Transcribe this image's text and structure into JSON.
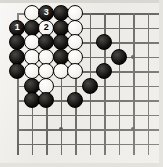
{
  "figure": {
    "board_size_label": "19x19 (corner excerpt)",
    "background_color": "#efeeea",
    "line_color": "#262421",
    "black_stone_color": "#131110",
    "white_stone_color": "#f4f3ef"
  },
  "geometry": {
    "origin_x": 17,
    "origin_y": 13,
    "spacing": 14.5,
    "cols": 10,
    "rows": 10,
    "stone_diameter": 16
  },
  "star_points": [
    {
      "col": 4,
      "row": 9,
      "name": "star-point-lower-left"
    },
    {
      "col": 9,
      "row": 9,
      "name": "star-point-lower-right"
    },
    {
      "col": 9,
      "row": 4,
      "name": "star-point-upper-right"
    }
  ],
  "stones": [
    {
      "col": 2,
      "row": 1,
      "color": "white",
      "label": ""
    },
    {
      "col": 3,
      "row": 1,
      "color": "black",
      "label": "3"
    },
    {
      "col": 4,
      "row": 1,
      "color": "black",
      "label": ""
    },
    {
      "col": 5,
      "row": 1,
      "color": "white",
      "label": ""
    },
    {
      "col": 1,
      "row": 2,
      "color": "black",
      "label": "1"
    },
    {
      "col": 2,
      "row": 2,
      "color": "black",
      "label": ""
    },
    {
      "col": 3,
      "row": 2,
      "color": "white",
      "label": "2"
    },
    {
      "col": 4,
      "row": 2,
      "color": "black",
      "label": ""
    },
    {
      "col": 5,
      "row": 2,
      "color": "white",
      "label": ""
    },
    {
      "col": 1,
      "row": 3,
      "color": "black",
      "label": ""
    },
    {
      "col": 2,
      "row": 3,
      "color": "white",
      "label": ""
    },
    {
      "col": 3,
      "row": 3,
      "color": "black",
      "label": ""
    },
    {
      "col": 4,
      "row": 3,
      "color": "black",
      "label": ""
    },
    {
      "col": 5,
      "row": 3,
      "color": "white",
      "label": ""
    },
    {
      "col": 7,
      "row": 3,
      "color": "black",
      "label": ""
    },
    {
      "col": 1,
      "row": 4,
      "color": "black",
      "label": ""
    },
    {
      "col": 2,
      "row": 4,
      "color": "white",
      "label": ""
    },
    {
      "col": 3,
      "row": 4,
      "color": "white",
      "label": ""
    },
    {
      "col": 4,
      "row": 4,
      "color": "black",
      "label": ""
    },
    {
      "col": 5,
      "row": 4,
      "color": "white",
      "label": ""
    },
    {
      "col": 8,
      "row": 4,
      "color": "black",
      "label": ""
    },
    {
      "col": 1,
      "row": 5,
      "color": "black",
      "label": ""
    },
    {
      "col": 2,
      "row": 5,
      "color": "white",
      "label": ""
    },
    {
      "col": 3,
      "row": 5,
      "color": "white",
      "label": ""
    },
    {
      "col": 4,
      "row": 5,
      "color": "white",
      "label": ""
    },
    {
      "col": 5,
      "row": 5,
      "color": "white",
      "label": ""
    },
    {
      "col": 7,
      "row": 5,
      "color": "black",
      "label": ""
    },
    {
      "col": 2,
      "row": 6,
      "color": "black",
      "label": ""
    },
    {
      "col": 3,
      "row": 6,
      "color": "white",
      "label": ""
    },
    {
      "col": 6,
      "row": 6,
      "color": "black",
      "label": ""
    },
    {
      "col": 2,
      "row": 7,
      "color": "black",
      "label": ""
    },
    {
      "col": 3,
      "row": 7,
      "color": "black",
      "label": ""
    },
    {
      "col": 5,
      "row": 7,
      "color": "black",
      "label": ""
    }
  ],
  "move_sequence": [
    {
      "number": "1",
      "color": "black",
      "col": 1,
      "row": 2
    },
    {
      "number": "2",
      "color": "white",
      "col": 3,
      "row": 2
    },
    {
      "number": "3",
      "color": "black",
      "col": 3,
      "row": 1
    }
  ]
}
